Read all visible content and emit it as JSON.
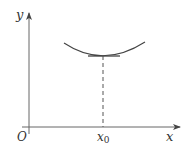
{
  "diagram": {
    "type": "function-graph-tangent-at-minimum",
    "axes": {
      "x_label": "x",
      "y_label": "y",
      "origin_label": "O"
    },
    "point": {
      "label_base": "x",
      "label_subscript": "0"
    },
    "colors": {
      "axis": "#555555",
      "curve": "#444444",
      "text": "#333333"
    }
  }
}
